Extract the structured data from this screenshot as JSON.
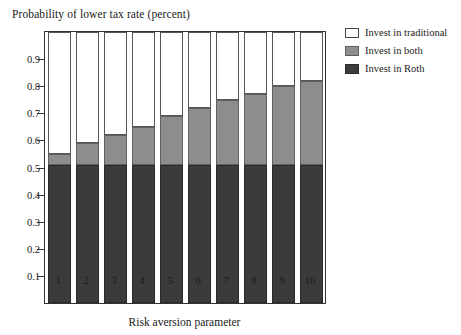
{
  "chart_data": {
    "type": "bar",
    "title": "Probability of lower tax rate (percent)",
    "subtitle": "",
    "xlabel": "Risk aversion parameter",
    "ylabel": "",
    "categories": [
      "1",
      "2",
      "3",
      "4",
      "5",
      "6",
      "7",
      "8",
      "9",
      "10"
    ],
    "stacked": true,
    "ylim": [
      0,
      1
    ],
    "yticks": [
      "0.1",
      "0.2",
      "0.3",
      "0.4",
      "0.5",
      "0.6",
      "0.7",
      "0.8",
      "0.9"
    ],
    "ytick_values": [
      0.1,
      0.2,
      0.3,
      0.4,
      0.5,
      0.6,
      0.7,
      0.8,
      0.9
    ],
    "grid": false,
    "legend_position": "right",
    "series": [
      {
        "name": "Invest in Roth",
        "color": "#3b3b3b",
        "values": [
          0.51,
          0.51,
          0.51,
          0.51,
          0.51,
          0.51,
          0.51,
          0.51,
          0.51,
          0.51
        ]
      },
      {
        "name": "Invest in both",
        "color": "#8d8d8d",
        "values": [
          0.04,
          0.08,
          0.11,
          0.14,
          0.18,
          0.21,
          0.24,
          0.26,
          0.29,
          0.31
        ]
      },
      {
        "name": "Invest in traditional",
        "color": "#ffffff",
        "values": [
          0.46,
          0.42,
          0.39,
          0.36,
          0.32,
          0.29,
          0.26,
          0.24,
          0.21,
          0.19
        ]
      }
    ],
    "cumulative_tops": {
      "roth": [
        0.51,
        0.51,
        0.51,
        0.51,
        0.51,
        0.51,
        0.51,
        0.51,
        0.51,
        0.51
      ],
      "both": [
        0.55,
        0.59,
        0.62,
        0.65,
        0.69,
        0.72,
        0.75,
        0.77,
        0.8,
        0.82
      ],
      "traditional": [
        1.0,
        1.0,
        1.0,
        1.0,
        1.0,
        1.0,
        1.0,
        1.0,
        1.0,
        1.0
      ]
    }
  },
  "legend": {
    "items": [
      {
        "label": "Invest in traditional",
        "swatch": "white-square-icon"
      },
      {
        "label": "Invest in both",
        "swatch": "gray-square-icon"
      },
      {
        "label": "Invest in Roth",
        "swatch": "dark-square-icon"
      }
    ]
  }
}
